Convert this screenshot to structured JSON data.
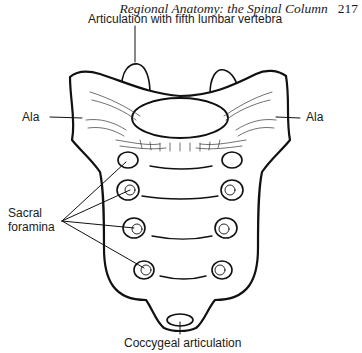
{
  "header": {
    "running_title": "Regional Anatomy: the Spinal Column",
    "page_number": "217"
  },
  "figure": {
    "labels": {
      "top": "Articulation with fifth lumbar vertebra",
      "ala_left": "Ala",
      "ala_right": "Ala",
      "sacral_foramina_line1": "Sacral",
      "sacral_foramina_line2": "foramina",
      "bottom": "Coccygeal articulation"
    },
    "foramina_pairs": 4
  }
}
